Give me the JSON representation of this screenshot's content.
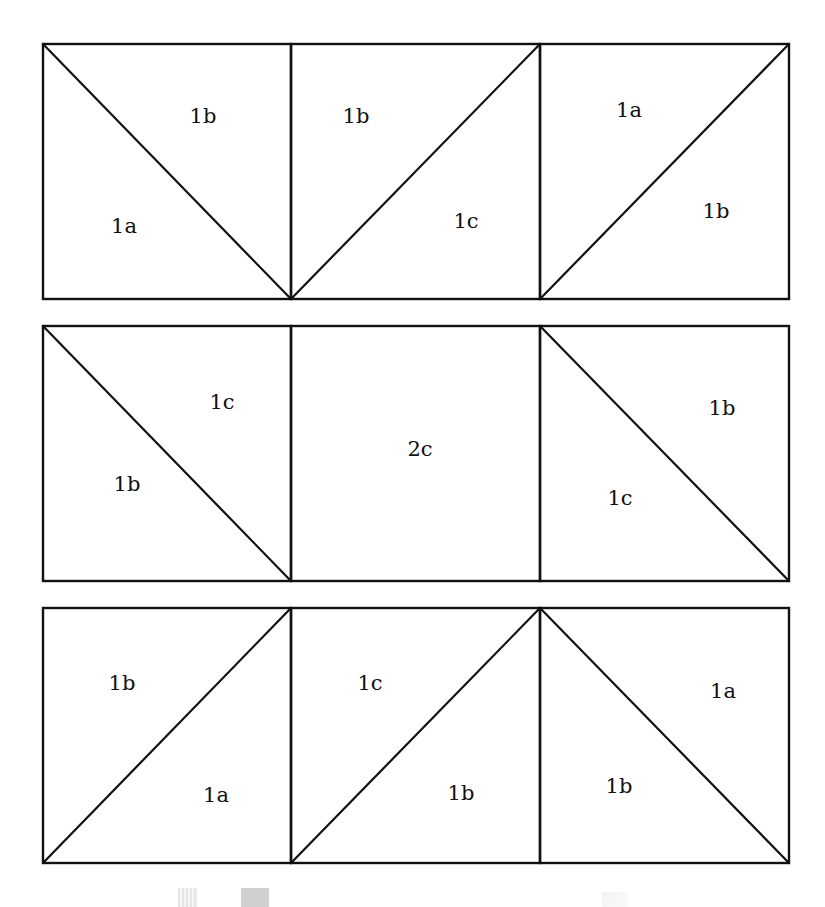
{
  "diagram": {
    "title": "",
    "stroke_color": "#111111",
    "background": "#ffffff",
    "rows": [
      {
        "id": "row-1",
        "top": 44,
        "bottom": 299,
        "cells": [
          {
            "left": 43,
            "right": 291,
            "diagonal": "tl-br",
            "labels": [
              {
                "text": "1b",
                "x": 203,
                "y": 117
              },
              {
                "text": "1a",
                "x": 124,
                "y": 227
              }
            ]
          },
          {
            "left": 291,
            "right": 540,
            "diagonal": "bl-tr",
            "labels": [
              {
                "text": "1b",
                "x": 356,
                "y": 117
              },
              {
                "text": "1c",
                "x": 466,
                "y": 222
              }
            ]
          },
          {
            "left": 540,
            "right": 789,
            "diagonal": "bl-tr",
            "labels": [
              {
                "text": "1a",
                "x": 629,
                "y": 111
              },
              {
                "text": "1b",
                "x": 716,
                "y": 212
              }
            ]
          }
        ]
      },
      {
        "id": "row-2",
        "top": 326,
        "bottom": 581,
        "cells": [
          {
            "left": 43,
            "right": 291,
            "diagonal": "tl-br",
            "labels": [
              {
                "text": "1c",
                "x": 222,
                "y": 403
              },
              {
                "text": "1b",
                "x": 127,
                "y": 485
              }
            ]
          },
          {
            "left": 291,
            "right": 540,
            "diagonal": "none",
            "labels": [
              {
                "text": "2c",
                "x": 420,
                "y": 450
              }
            ]
          },
          {
            "left": 540,
            "right": 789,
            "diagonal": "tl-br",
            "labels": [
              {
                "text": "1b",
                "x": 722,
                "y": 409
              },
              {
                "text": "1c",
                "x": 620,
                "y": 499
              }
            ]
          }
        ]
      },
      {
        "id": "row-3",
        "top": 608,
        "bottom": 863,
        "cells": [
          {
            "left": 43,
            "right": 291,
            "diagonal": "bl-tr",
            "labels": [
              {
                "text": "1b",
                "x": 122,
                "y": 684
              },
              {
                "text": "1a",
                "x": 216,
                "y": 796
              }
            ]
          },
          {
            "left": 291,
            "right": 540,
            "diagonal": "bl-tr",
            "labels": [
              {
                "text": "1c",
                "x": 370,
                "y": 684
              },
              {
                "text": "1b",
                "x": 461,
                "y": 794
              }
            ]
          },
          {
            "left": 540,
            "right": 789,
            "diagonal": "tl-br",
            "labels": [
              {
                "text": "1a",
                "x": 723,
                "y": 692
              },
              {
                "text": "1b",
                "x": 619,
                "y": 787
              }
            ]
          }
        ]
      }
    ]
  }
}
